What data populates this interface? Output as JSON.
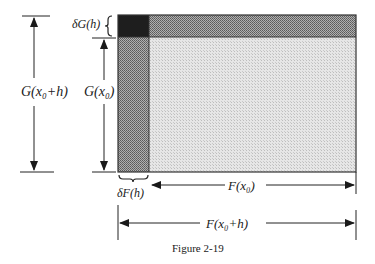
{
  "figure": {
    "caption": "Figure 2-19",
    "labels": {
      "delta_g": "δG(h)",
      "g_x0_plus_h": "G(x₀+h)",
      "g_x0": "G(x₀)",
      "delta_f": "δF(h)",
      "f_x0": "F(x₀)",
      "f_x0_plus_h": "F(x₀+h)"
    },
    "regions": [
      {
        "name": "F(x0)·G(x0)",
        "shade": "light",
        "color": "#d9d9d9"
      },
      {
        "name": "δF(h)·G(x0)",
        "shade": "medium",
        "color": "#8c8c8c"
      },
      {
        "name": "F(x0)·δG(h)",
        "shade": "medium",
        "color": "#7a7a7a"
      },
      {
        "name": "δF(h)·δG(h)",
        "shade": "dark",
        "color": "#1e1e1e"
      }
    ]
  }
}
